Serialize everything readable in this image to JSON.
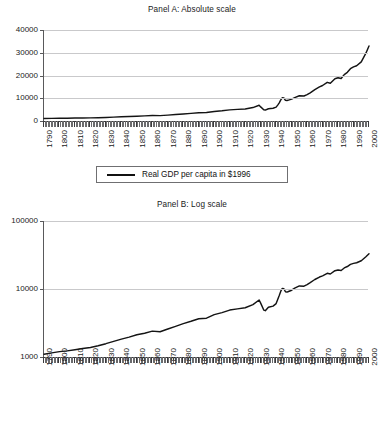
{
  "figure": {
    "background": "#ffffff",
    "line_color": "#141414",
    "grid_color": "#c9c9cb",
    "axis_color": "#3a3a3c"
  },
  "panel_a": {
    "title": "Panel A: Absolute scale",
    "legend_label": "Real GDP per capita in $1996",
    "y_ticks": [
      "40000",
      "30000",
      "20000",
      "10000",
      "0"
    ],
    "x_ticks": [
      "1790",
      "1800",
      "1810",
      "1820",
      "1830",
      "1840",
      "1850",
      "1860",
      "1870",
      "1880",
      "1890",
      "1900",
      "1910",
      "1920",
      "1930",
      "1940",
      "1950",
      "1960",
      "1970",
      "1980",
      "1990",
      "2000"
    ]
  },
  "panel_b": {
    "title": "Panel B: Log scale",
    "legend_label": "Real GDP per capita in $1996",
    "y_ticks": [
      "100000",
      "10000",
      "1000"
    ],
    "x_ticks": [
      "1790",
      "1800",
      "1810",
      "1820",
      "1830",
      "1840",
      "1850",
      "1860",
      "1870",
      "1880",
      "1890",
      "1900",
      "1910",
      "1920",
      "1930",
      "1940",
      "1950",
      "1960",
      "1970",
      "1980",
      "1990",
      "2000"
    ]
  },
  "chart_data": [
    {
      "type": "line",
      "title": "Panel A: Absolute scale",
      "xlabel": "",
      "ylabel": "",
      "scale": "linear",
      "xlim": [
        1790,
        2000
      ],
      "ylim": [
        0,
        40000
      ],
      "yticks": [
        0,
        10000,
        20000,
        30000,
        40000
      ],
      "xticks": [
        1790,
        1800,
        1810,
        1820,
        1830,
        1840,
        1850,
        1860,
        1870,
        1880,
        1890,
        1900,
        1910,
        1920,
        1930,
        1940,
        1950,
        1960,
        1970,
        1980,
        1990,
        2000
      ],
      "grid": "horizontal",
      "legend": {
        "position": "below",
        "entries": [
          "Real GDP per capita in $1996"
        ]
      },
      "series": [
        {
          "name": "Real GDP per capita in $1996",
          "x": [
            1790,
            1795,
            1800,
            1805,
            1810,
            1815,
            1820,
            1825,
            1830,
            1835,
            1840,
            1845,
            1850,
            1855,
            1860,
            1865,
            1870,
            1875,
            1880,
            1885,
            1890,
            1895,
            1900,
            1905,
            1910,
            1915,
            1920,
            1925,
            1929,
            1930,
            1932,
            1933,
            1935,
            1938,
            1940,
            1941,
            1942,
            1943,
            1944,
            1945,
            1946,
            1947,
            1948,
            1950,
            1952,
            1955,
            1958,
            1960,
            1962,
            1965,
            1968,
            1970,
            1973,
            1975,
            1978,
            1980,
            1982,
            1984,
            1986,
            1988,
            1990,
            1992,
            1995,
            1998,
            2000
          ],
          "y": [
            1100,
            1150,
            1200,
            1230,
            1280,
            1330,
            1380,
            1460,
            1570,
            1700,
            1830,
            1960,
            2120,
            2240,
            2400,
            2350,
            2580,
            2820,
            3100,
            3350,
            3650,
            3720,
            4200,
            4500,
            4900,
            5100,
            5300,
            5900,
            6900,
            6200,
            4900,
            4800,
            5400,
            5600,
            6100,
            7000,
            8000,
            9300,
            10200,
            10100,
            9100,
            9000,
            9200,
            9600,
            10300,
            11100,
            11000,
            11600,
            12400,
            13800,
            15000,
            15600,
            17000,
            16600,
            18600,
            19000,
            18700,
            20400,
            21400,
            23000,
            23800,
            24300,
            26000,
            29800,
            33000
          ]
        }
      ]
    },
    {
      "type": "line",
      "title": "Panel B: Log scale",
      "xlabel": "",
      "ylabel": "",
      "scale": "log",
      "xlim": [
        1790,
        2000
      ],
      "ylim": [
        1000,
        100000
      ],
      "yticks": [
        1000,
        10000,
        100000
      ],
      "xticks": [
        1790,
        1800,
        1810,
        1820,
        1830,
        1840,
        1850,
        1860,
        1870,
        1880,
        1890,
        1900,
        1910,
        1920,
        1930,
        1940,
        1950,
        1960,
        1970,
        1980,
        1990,
        2000
      ],
      "grid": "horizontal",
      "legend": {
        "position": "below",
        "entries": [
          "Real GDP per capita in $1996"
        ]
      },
      "series": [
        {
          "name": "Real GDP per capita in $1996",
          "x": [
            1790,
            1795,
            1800,
            1805,
            1810,
            1815,
            1820,
            1825,
            1830,
            1835,
            1840,
            1845,
            1850,
            1855,
            1860,
            1865,
            1870,
            1875,
            1880,
            1885,
            1890,
            1895,
            1900,
            1905,
            1910,
            1915,
            1920,
            1925,
            1929,
            1930,
            1932,
            1933,
            1935,
            1938,
            1940,
            1941,
            1942,
            1943,
            1944,
            1945,
            1946,
            1947,
            1948,
            1950,
            1952,
            1955,
            1958,
            1960,
            1962,
            1965,
            1968,
            1970,
            1973,
            1975,
            1978,
            1980,
            1982,
            1984,
            1986,
            1988,
            1990,
            1992,
            1995,
            1998,
            2000
          ],
          "y": [
            1100,
            1150,
            1200,
            1230,
            1280,
            1330,
            1380,
            1460,
            1570,
            1700,
            1830,
            1960,
            2120,
            2240,
            2400,
            2350,
            2580,
            2820,
            3100,
            3350,
            3650,
            3720,
            4200,
            4500,
            4900,
            5100,
            5300,
            5900,
            6900,
            6200,
            4900,
            4800,
            5400,
            5600,
            6100,
            7000,
            8000,
            9300,
            10200,
            10100,
            9100,
            9000,
            9200,
            9600,
            10300,
            11100,
            11000,
            11600,
            12400,
            13800,
            15000,
            15600,
            17000,
            16600,
            18600,
            19000,
            18700,
            20400,
            21400,
            23000,
            23800,
            24300,
            26000,
            29800,
            33000
          ]
        }
      ]
    }
  ]
}
